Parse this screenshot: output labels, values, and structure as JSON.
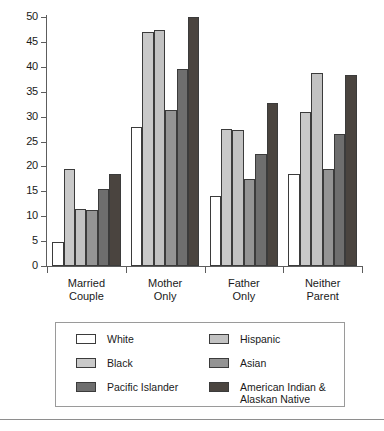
{
  "chart_data": {
    "type": "bar",
    "title": "",
    "xlabel": "",
    "ylabel": "",
    "ylim": [
      0,
      50
    ],
    "ytick_step": 5,
    "yticks": [
      0,
      5,
      10,
      15,
      20,
      25,
      30,
      35,
      40,
      45,
      50
    ],
    "grid": false,
    "legend_position": "bottom",
    "categories": [
      "Married Couple",
      "Mother Only",
      "Father Only",
      "Neither Parent"
    ],
    "category_lines": [
      [
        "Married",
        "Couple"
      ],
      [
        "Mother",
        "Only"
      ],
      [
        "Father",
        "Only"
      ],
      [
        "Neither",
        "Parent"
      ]
    ],
    "series": [
      {
        "name": "White",
        "color": "#ffffff",
        "values": [
          4.8,
          28.0,
          14.0,
          18.5
        ]
      },
      {
        "name": "Black",
        "color": "#c9c9c9",
        "values": [
          19.5,
          47.0,
          27.5,
          31.0
        ]
      },
      {
        "name": "Hispanic",
        "color": "#c2c2c2",
        "values": [
          11.5,
          47.3,
          27.3,
          38.8
        ]
      },
      {
        "name": "Asian",
        "color": "#949494",
        "values": [
          11.3,
          31.3,
          17.5,
          19.5
        ]
      },
      {
        "name": "Pacific Islander",
        "color": "#6e6e6e",
        "values": [
          15.5,
          39.5,
          22.5,
          26.5
        ]
      },
      {
        "name": "American Indian &\nAlaskan Native",
        "color": "#4a443f",
        "values": [
          18.5,
          50.0,
          32.8,
          38.3
        ]
      }
    ]
  },
  "legend": {
    "entries": [
      {
        "label": "White",
        "color": "#ffffff"
      },
      {
        "label": "Hispanic",
        "color": "#c2c2c2"
      },
      {
        "label": "Black",
        "color": "#c9c9c9"
      },
      {
        "label": "Asian",
        "color": "#949494"
      },
      {
        "label": "Pacific Islander",
        "color": "#6e6e6e"
      },
      {
        "label": "American Indian &\nAlaskan Native",
        "color": "#4a443f"
      }
    ]
  },
  "axis": {
    "y_tick_labels": [
      "50",
      "45",
      "40",
      "35",
      "30",
      "25",
      "20",
      "15",
      "10",
      "5",
      "0"
    ]
  }
}
